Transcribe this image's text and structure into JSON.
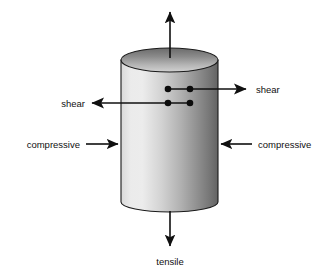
{
  "figure": {
    "background_color": "#ffffff",
    "line_color": "#101010",
    "canvas": {
      "width": 333,
      "height": 273
    }
  },
  "specimen": {
    "name": "cylinder",
    "shape": "cylinder",
    "left_x": 121,
    "right_x": 218,
    "top_ellipse_center_y": 60,
    "top_ellipse_ry": 12,
    "bottom_y": 202,
    "bottom_ellipse_ry": 10,
    "body_gradient_light": "#eeeeee",
    "body_gradient_dark": "#666666",
    "top_gradient_light": "#c8c8c8",
    "top_gradient_dark": "#6e6e6e",
    "outline_color": "#1a1a1a"
  },
  "labels": {
    "tensile_top": "",
    "tensile_bottom": "tensile",
    "shear_left": "shear",
    "shear_right": "shear",
    "compressive_left": "compressive",
    "compressive_right": "compressive"
  },
  "annotations": [
    {
      "id": "tensile-up-arrow",
      "label": "",
      "direction": "up",
      "from": [
        170,
        57
      ],
      "to": [
        170,
        8
      ]
    },
    {
      "id": "tensile-down-arrow",
      "label": "tensile",
      "direction": "down",
      "from": [
        170,
        212
      ],
      "to": [
        170,
        248
      ],
      "label_position": [
        170,
        265
      ]
    },
    {
      "id": "shear-right-arrow",
      "label": "shear",
      "direction": "right",
      "from": [
        168,
        89
      ],
      "to": [
        249,
        89
      ],
      "label_position": [
        256,
        92
      ]
    },
    {
      "id": "shear-left-arrow",
      "label": "shear",
      "direction": "left",
      "from": [
        190,
        103
      ],
      "to": [
        90,
        103
      ],
      "label_position": [
        84,
        106
      ]
    },
    {
      "id": "compressive-left-arrow",
      "label": "compressive",
      "direction": "right",
      "from": [
        85,
        144
      ],
      "to": [
        120,
        144
      ],
      "label_position": [
        79,
        147
      ]
    },
    {
      "id": "compressive-right-arrow",
      "label": "compressive",
      "direction": "left",
      "from": [
        252,
        144
      ],
      "to": [
        219,
        144
      ],
      "label_position": [
        258,
        147
      ]
    }
  ],
  "stress_points": [
    {
      "id": "shear-dot-upper-left",
      "x": 168,
      "y": 89,
      "r": 3.2
    },
    {
      "id": "shear-dot-upper-right",
      "x": 190,
      "y": 89,
      "r": 3.2
    },
    {
      "id": "shear-dot-lower-left",
      "x": 168,
      "y": 103,
      "r": 3.2
    },
    {
      "id": "shear-dot-lower-right",
      "x": 190,
      "y": 103,
      "r": 3.2
    }
  ]
}
